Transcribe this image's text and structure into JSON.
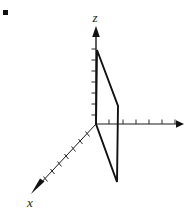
{
  "figure": {
    "background_color": "#ffffff",
    "line_color": "#111111",
    "width": 192,
    "height": 212
  },
  "labels": {
    "z_axis": "z",
    "x_axis": "x",
    "y_axis": ""
  },
  "chart_data": {
    "type": "line",
    "xlabel": "x",
    "ylabel": "",
    "zlabel": "z",
    "grid": false,
    "legend": "none",
    "axes": [
      {
        "name": "z-axis",
        "direction": "up",
        "origin_px": [
          96,
          124
        ],
        "end_px": [
          96,
          28
        ],
        "arrow": true,
        "tick_count": 6
      },
      {
        "name": "y-axis",
        "direction": "right",
        "origin_px": [
          96,
          124
        ],
        "end_px": [
          180,
          124
        ],
        "arrow": true,
        "tick_count": 5
      },
      {
        "name": "x-axis",
        "direction": "down-left",
        "origin_px": [
          96,
          124
        ],
        "end_px": [
          32,
          192
        ],
        "arrow": true,
        "tick_count": 8
      }
    ],
    "series": [
      {
        "name": "region-quadrilateral",
        "closed": true,
        "points_px": [
          [
            97,
            50
          ],
          [
            118,
            106
          ],
          [
            117,
            182
          ],
          [
            96,
            124
          ]
        ]
      }
    ],
    "annotations": [
      {
        "name": "corner-dot",
        "position_px": [
          5,
          12
        ],
        "size_px": 5
      }
    ]
  }
}
